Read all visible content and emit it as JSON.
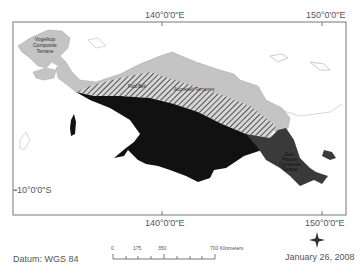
{
  "map": {
    "axis_labels": {
      "top_140": "140°0'0\"E",
      "top_150": "150°0'0\"E",
      "bottom_140": "140°0'0\"E",
      "bottom_150": "150°0'0\"E",
      "left_10s": "-10°0'0\"S"
    },
    "regions": [
      {
        "name": "Vogelkop Composite Terrane",
        "lines": [
          "Vogelkop",
          "Composite",
          "Terrane"
        ],
        "color": "#c4c4c4"
      },
      {
        "name": "Accreted Terranes",
        "color": "#c4c4c4"
      },
      {
        "name": "Fold Belt",
        "pattern": "hatched"
      },
      {
        "name": "Australian Craton",
        "color": "#111111"
      },
      {
        "name": "East Papuan Composite Terrane",
        "lines": [
          "East",
          "Papuan",
          "Composite",
          "Terrane"
        ],
        "color": "#3a3a3a"
      }
    ],
    "labels": {
      "vogelkop_1": "Vogelkop",
      "vogelkop_2": "Composite",
      "vogelkop_3": "Terrane",
      "accreted": "Accreted Terranes",
      "fold_belt": "Fold Belt",
      "east_1": "East",
      "east_2": "Papuan",
      "east_3": "Composite",
      "east_4": "Terrane"
    }
  },
  "footer": {
    "datum": "Datum: WGS 84",
    "date": "January 26, 2008",
    "north_label": "N",
    "scale": {
      "ticks": [
        "0",
        "175",
        "350",
        "700 Kilometers"
      ]
    }
  }
}
